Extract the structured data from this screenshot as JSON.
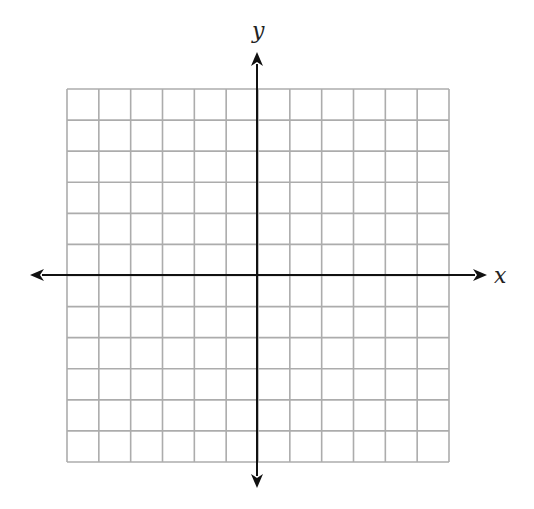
{
  "diagram": {
    "type": "coordinate-plane",
    "x_axis_label": "x",
    "y_axis_label": "y",
    "grid": {
      "columns": 12,
      "rows": 12,
      "left": 67,
      "top": 89,
      "right": 449,
      "bottom": 462,
      "line_color": "#acacac"
    },
    "axes": {
      "origin_x": 257,
      "origin_y": 275,
      "x_arrow_left": 30,
      "x_arrow_right": 487,
      "y_arrow_top": 52,
      "y_arrow_bottom": 488,
      "color": "#111111"
    },
    "colors": {
      "background": "#ffffff",
      "grid": "#acacac",
      "axis": "#111111"
    }
  }
}
